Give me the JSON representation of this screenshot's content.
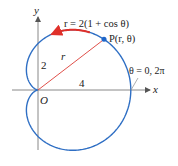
{
  "figure": {
    "equation_label": "r = 2(1 + cos θ)",
    "point_label": "P(r, θ)",
    "angle_label": "θ = 0, 2π",
    "axis_x_label": "x",
    "axis_y_label": "y",
    "origin_label": "O",
    "radius_label": "r",
    "y_intercept_label": "2",
    "x_intercept_label": "4",
    "colors": {
      "curve": "#2f6fc4",
      "radius_line": "#e0504a",
      "direction_arrow": "#e0302a",
      "point": "#1f66c9",
      "axes": "#888888"
    },
    "curve": {
      "type": "cardioid",
      "equation": "r = 2(1 + cos θ)",
      "point_theta_deg": 37.5
    }
  }
}
